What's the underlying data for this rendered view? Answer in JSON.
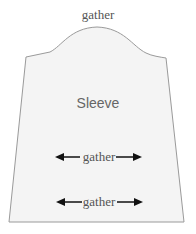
{
  "diagram": {
    "title_label": "gather",
    "piece_label": "Sleeve",
    "gather_marks": [
      {
        "label": "gather"
      },
      {
        "label": "gather"
      }
    ],
    "colors": {
      "fill": "#f4f4f4",
      "outline": "#9a9a9a",
      "arrow": "#111111",
      "text": "#555555"
    }
  }
}
